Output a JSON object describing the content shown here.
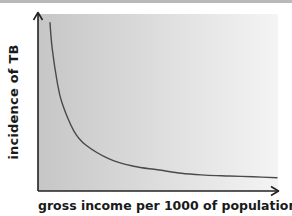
{
  "chart_data": {
    "type": "line",
    "title": "",
    "xlabel": "gross income per 1000 of population",
    "ylabel": "incidence of TB",
    "x_ticks": [],
    "y_ticks": [],
    "grid": false,
    "legend": null,
    "qualitative": true,
    "series": [
      {
        "name": "incidence of TB",
        "color": "#4a4a4a",
        "x": [
          0.05,
          0.06,
          0.08,
          0.1,
          0.15,
          0.2,
          0.3,
          0.4,
          0.5,
          0.6,
          0.7,
          0.8,
          0.9,
          1.0
        ],
        "values": [
          0.95,
          0.8,
          0.62,
          0.5,
          0.34,
          0.26,
          0.18,
          0.14,
          0.12,
          0.1,
          0.09,
          0.085,
          0.08,
          0.075
        ]
      }
    ],
    "xlim": [
      0,
      1
    ],
    "ylim": [
      0,
      1
    ]
  },
  "colors": {
    "plot_bg_left": "#c6c6c6",
    "plot_bg_right": "#f4f4f4",
    "axis": "#222222",
    "curve": "#4a4a4a",
    "top_strip": "#b9b9b9"
  }
}
